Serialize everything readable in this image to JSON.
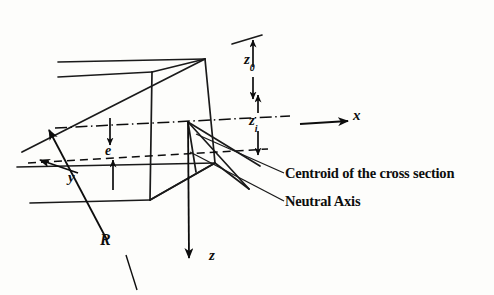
{
  "figure": {
    "title_semantic": "curved-beam-trapezoidal-cross-section-diagram",
    "labels": {
      "z_outer": {
        "base": "z",
        "sub": "0"
      },
      "z_inner": {
        "base": "z",
        "sub": "i"
      },
      "eccentricity": "e",
      "radius": "R",
      "axis_x": "x",
      "axis_y": "y",
      "axis_z": "z"
    },
    "callouts": {
      "centroid": "Centroid of the cross section",
      "neutral_axis": "Neutral Axis"
    },
    "colors": {
      "ink": "#0d0d0d",
      "line": "#1a1a1a",
      "background": "#fdfdfb"
    },
    "line_styles": {
      "centroidal_axis": "dash-dot",
      "neutral_axis": "dashed",
      "solid_body": "solid"
    }
  }
}
